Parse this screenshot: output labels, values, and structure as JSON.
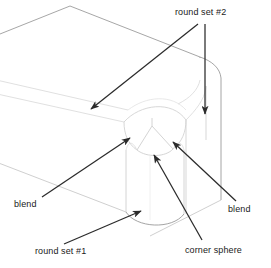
{
  "figure": {
    "background_color": "#ffffff",
    "line_color_faint": "#d8d8d8",
    "line_color_edge": "#9a9a9a",
    "line_color_leader": "#2b2b2b",
    "text_color": "#1a1a1a"
  },
  "labels": {
    "round_set_2": "round set #2",
    "round_set_1": "round set #1",
    "blend_left": "blend",
    "blend_right": "blend",
    "corner_sphere": "corner sphere"
  },
  "annotations": [
    {
      "id": "round-set-2",
      "text": "round set #2",
      "text_position": {
        "x": 175,
        "y": 8
      },
      "leaders": [
        {
          "from": {
            "x": 198,
            "y": 22
          },
          "to": {
            "x": 90,
            "y": 110
          }
        },
        {
          "from": {
            "x": 205,
            "y": 22
          },
          "to": {
            "x": 205,
            "y": 116
          }
        }
      ]
    },
    {
      "id": "blend-left",
      "text": "blend",
      "text_position": {
        "x": 14,
        "y": 200
      },
      "leaders": [
        {
          "from": {
            "x": 44,
            "y": 196
          },
          "to": {
            "x": 131,
            "y": 138
          }
        }
      ]
    },
    {
      "id": "blend-right",
      "text": "blend",
      "text_position": {
        "x": 228,
        "y": 205
      },
      "leaders": [
        {
          "from": {
            "x": 234,
            "y": 200
          },
          "to": {
            "x": 172,
            "y": 141
          }
        }
      ]
    },
    {
      "id": "round-set-1",
      "text": "round set #1",
      "text_position": {
        "x": 35,
        "y": 247
      },
      "leaders": [
        {
          "from": {
            "x": 66,
            "y": 243
          },
          "to": {
            "x": 142,
            "y": 212
          }
        }
      ]
    },
    {
      "id": "corner-sphere",
      "text": "corner sphere",
      "text_position": {
        "x": 185,
        "y": 246
      },
      "leaders": [
        {
          "from": {
            "x": 200,
            "y": 241
          },
          "to": {
            "x": 155,
            "y": 155
          }
        }
      ]
    }
  ],
  "geometry": {
    "description": "Isometric view of a box end whose vertical corner carries round set #1, whose horizontal top edges carry round set #2, joined by two blend surfaces meeting at a corner sphere patch.",
    "features": [
      {
        "name": "top-face",
        "kind": "planar-face"
      },
      {
        "name": "front-left-face",
        "kind": "planar-face"
      },
      {
        "name": "right-face",
        "kind": "planar-face"
      },
      {
        "name": "vertical-corner-round",
        "kind": "cylindrical-fillet",
        "label_ref": "round_set_1"
      },
      {
        "name": "top-edge-round-left",
        "kind": "cylindrical-fillet",
        "label_ref": "round_set_2"
      },
      {
        "name": "top-edge-round-right",
        "kind": "cylindrical-fillet",
        "label_ref": "round_set_2"
      },
      {
        "name": "blend-surface-left",
        "kind": "blend-patch",
        "label_ref": "blend_left"
      },
      {
        "name": "blend-surface-right",
        "kind": "blend-patch",
        "label_ref": "blend_right"
      },
      {
        "name": "corner-sphere-patch",
        "kind": "spherical-patch",
        "label_ref": "corner_sphere"
      }
    ]
  }
}
